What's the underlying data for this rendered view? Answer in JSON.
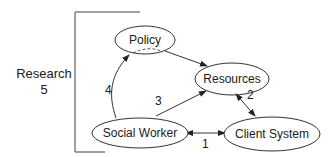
{
  "diagram": {
    "nodes": {
      "policy": "Policy",
      "resources": "Resources",
      "social_worker": "Social Worker",
      "client_system": "Client System"
    },
    "side_label": {
      "line1": "Research",
      "line2": "5"
    },
    "edge_labels": {
      "e1": "1",
      "e2": "2",
      "e3": "3",
      "e4": "4"
    },
    "colors": {
      "stroke": "#333333",
      "background": "#ffffff"
    }
  }
}
